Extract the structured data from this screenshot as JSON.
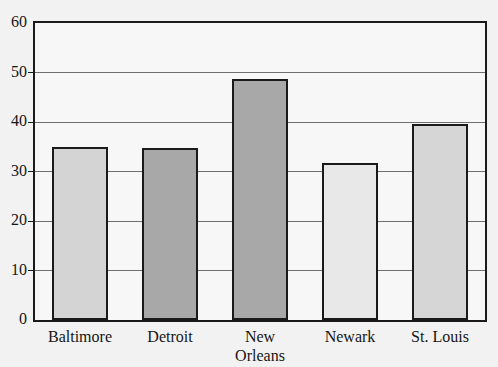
{
  "chart_data": {
    "type": "bar",
    "title": "",
    "xlabel": "",
    "ylabel": "",
    "categories": [
      "Baltimore",
      "Detroit",
      "New\nOrleans",
      "Newark",
      "St. Louis"
    ],
    "values": [
      34.9,
      34.8,
      48.7,
      31.7,
      39.6
    ],
    "bar_colors": [
      "#d4d4d4",
      "#a8a8a8",
      "#a8a8a8",
      "#e8e8e8",
      "#d6d6d6"
    ],
    "bar_border_color": "#1a1a1a",
    "ylim": [
      0,
      60
    ],
    "yticks": [
      0,
      10,
      20,
      30,
      40,
      50,
      60
    ],
    "ytick_labels": [
      "0",
      "10",
      "20",
      "30",
      "40",
      "50",
      "60"
    ],
    "grid": true,
    "grid_axis": "y",
    "legend": null,
    "legend_position": "none",
    "plot_background": "#f7f7f7",
    "figure_background": "#f2f2f2",
    "frame_color": "#1a1a1a"
  }
}
